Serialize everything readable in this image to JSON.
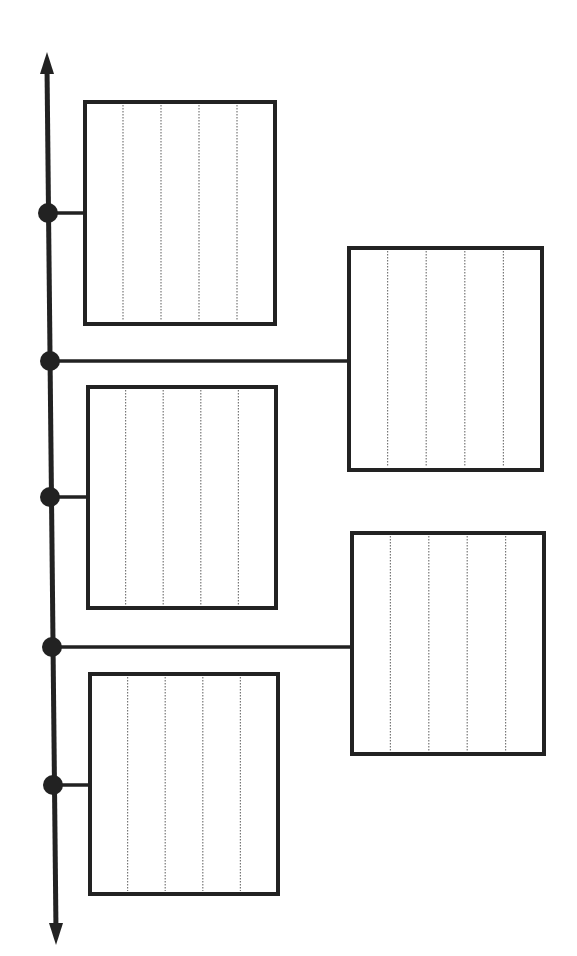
{
  "diagram": {
    "type": "vertical-timeline-worksheet",
    "colors": {
      "stroke": "#222222",
      "background": "#ffffff",
      "dotted": "#777777"
    },
    "axis": {
      "x_top": 47,
      "y_top": 52,
      "x_bottom": 56,
      "y_bottom": 945,
      "arrows": [
        "up",
        "down"
      ]
    },
    "events": [
      {
        "id": 1,
        "side": "left",
        "node": [
          48,
          213
        ],
        "box": {
          "x": 85,
          "y": 102,
          "w": 190,
          "h": 222
        }
      },
      {
        "id": 2,
        "side": "right",
        "node": [
          50,
          361
        ],
        "box": {
          "x": 349,
          "y": 248,
          "w": 193,
          "h": 222
        }
      },
      {
        "id": 3,
        "side": "left",
        "node": [
          50,
          497
        ],
        "box": {
          "x": 88,
          "y": 387,
          "w": 188,
          "h": 221
        }
      },
      {
        "id": 4,
        "side": "right",
        "node": [
          52,
          647
        ],
        "box": {
          "x": 352,
          "y": 533,
          "w": 192,
          "h": 221
        }
      },
      {
        "id": 5,
        "side": "left",
        "node": [
          53,
          785
        ],
        "box": {
          "x": 90,
          "y": 674,
          "w": 188,
          "h": 220
        }
      }
    ],
    "dividers_per_box": 4,
    "labels": []
  }
}
